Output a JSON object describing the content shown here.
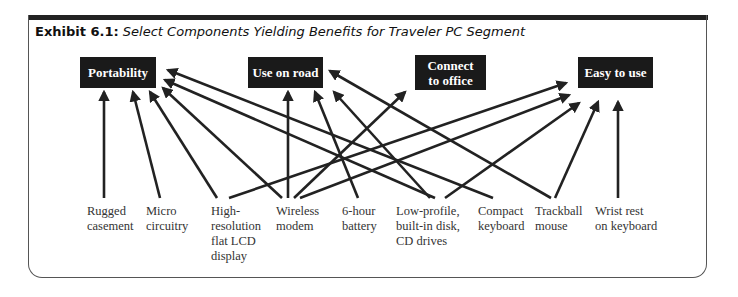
{
  "exhibit": {
    "number": "Exhibit 6.1:",
    "title": "Select Components Yielding Benefits for Traveler PC Segment"
  },
  "benefits": [
    {
      "id": "portability",
      "label": "Portability"
    },
    {
      "id": "use-on-road",
      "label": "Use on road"
    },
    {
      "id": "connect-to-office",
      "label": "Connect to office"
    },
    {
      "id": "easy-to-use",
      "label": "Easy to use"
    }
  ],
  "components": [
    {
      "id": "rugged-casement",
      "label": "Rugged\ncasement"
    },
    {
      "id": "micro-circuitry",
      "label": "Micro\ncircuitry"
    },
    {
      "id": "high-res-lcd",
      "label": "High-\nresolution\nflat LCD\ndisplay"
    },
    {
      "id": "wireless-modem",
      "label": "Wireless\nmodem"
    },
    {
      "id": "battery",
      "label": "6-hour\nbattery"
    },
    {
      "id": "low-profile-drives",
      "label": "Low-profile,\nbuilt-in disk,\nCD drives"
    },
    {
      "id": "compact-keyboard",
      "label": "Compact\nkeyboard"
    },
    {
      "id": "trackball-mouse",
      "label": "Trackball\nmouse"
    },
    {
      "id": "wrist-rest",
      "label": "Wrist rest\non keyboard"
    }
  ],
  "links": [
    {
      "from": "rugged-casement",
      "to": "portability"
    },
    {
      "from": "micro-circuitry",
      "to": "portability"
    },
    {
      "from": "high-res-lcd",
      "to": "portability"
    },
    {
      "from": "wireless-modem",
      "to": "portability"
    },
    {
      "from": "low-profile-drives",
      "to": "portability"
    },
    {
      "from": "compact-keyboard",
      "to": "portability"
    },
    {
      "from": "wireless-modem",
      "to": "use-on-road"
    },
    {
      "from": "battery",
      "to": "use-on-road"
    },
    {
      "from": "low-profile-drives",
      "to": "use-on-road"
    },
    {
      "from": "trackball-mouse",
      "to": "use-on-road"
    },
    {
      "from": "wireless-modem",
      "to": "connect-to-office"
    },
    {
      "from": "high-res-lcd",
      "to": "easy-to-use"
    },
    {
      "from": "wireless-modem",
      "to": "easy-to-use"
    },
    {
      "from": "low-profile-drives",
      "to": "easy-to-use"
    },
    {
      "from": "trackball-mouse",
      "to": "easy-to-use"
    },
    {
      "from": "wrist-rest",
      "to": "easy-to-use"
    }
  ],
  "colors": {
    "box_fill": "#1a1a1a",
    "box_text": "#ffffff",
    "arrow": "#222222",
    "header_bar": "#222222"
  }
}
